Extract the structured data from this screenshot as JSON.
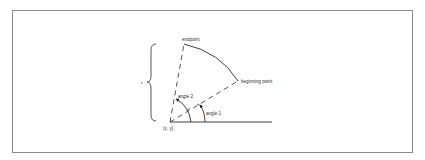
{
  "diagram": {
    "type": "arc-geometry",
    "labels": {
      "endpoint": "endpoint",
      "beginning_point": "beginning point",
      "angle1": "angle 1",
      "angle2": "angle 2",
      "origin": "(x, y)",
      "radius": "r"
    },
    "colors": {
      "stroke": "#2a2a2a",
      "frame": "#8a8a8a",
      "background": "#ffffff"
    }
  }
}
